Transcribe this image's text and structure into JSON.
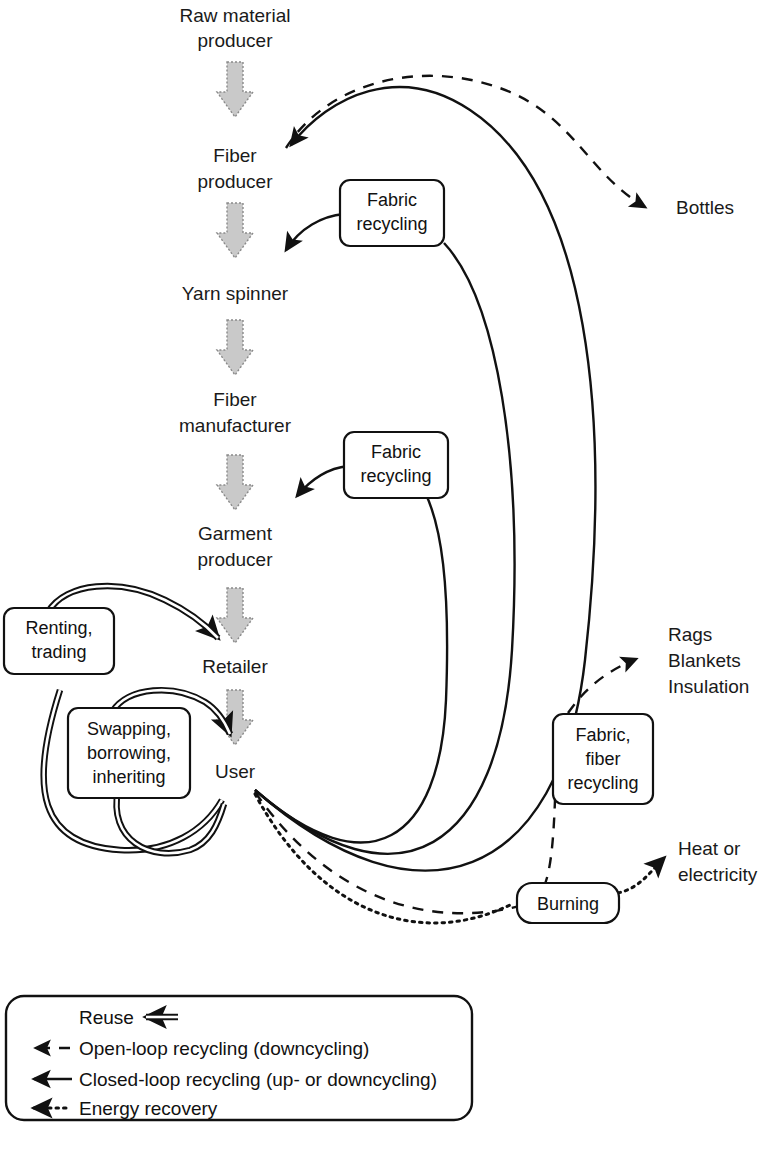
{
  "figure": {
    "type": "flow-diagram",
    "background": "#ffffff",
    "ink": "#111111",
    "gray_arrow_fill": "#c9c9c9",
    "gray_arrow_stroke": "#8a8a8a"
  },
  "chain_nodes": [
    {
      "id": "raw",
      "label_line1": "Raw material",
      "label_line2": "producer"
    },
    {
      "id": "fiberprod",
      "label_line1": "Fiber",
      "label_line2": "producer"
    },
    {
      "id": "yarn",
      "label_line1": "Yarn spinner",
      "label_line2": ""
    },
    {
      "id": "fibermfg",
      "label_line1": "Fiber",
      "label_line2": "manufacturer"
    },
    {
      "id": "garment",
      "label_line1": "Garment",
      "label_line2": "producer"
    },
    {
      "id": "retailer",
      "label_line1": "Retailer",
      "label_line2": ""
    },
    {
      "id": "user",
      "label_line1": "User",
      "label_line2": ""
    }
  ],
  "process_boxes": [
    {
      "id": "renting",
      "lines": [
        "Renting,",
        "trading"
      ]
    },
    {
      "id": "swapping",
      "lines": [
        "Swapping,",
        "borrowing,",
        "inheriting"
      ]
    },
    {
      "id": "fabric1",
      "lines": [
        "Fabric",
        "recycling"
      ]
    },
    {
      "id": "fabric2",
      "lines": [
        "Fabric",
        "recycling"
      ]
    },
    {
      "id": "fabfiber",
      "lines": [
        "Fabric,",
        "fiber",
        "recycling"
      ]
    },
    {
      "id": "burning",
      "lines": [
        "Burning"
      ]
    }
  ],
  "output_labels": [
    {
      "id": "bottles",
      "lines": [
        "Bottles"
      ]
    },
    {
      "id": "rags",
      "lines": [
        "Rags",
        "Blankets",
        "Insulation"
      ]
    },
    {
      "id": "heat",
      "lines": [
        "Heat or",
        "electricity"
      ]
    }
  ],
  "legend": {
    "items": [
      {
        "style": "reuse",
        "label": "Reuse"
      },
      {
        "style": "dashed",
        "label": "Open-loop recycling (downcycling)"
      },
      {
        "style": "solid",
        "label": "Closed-loop recycling (up- or downcycling)"
      },
      {
        "style": "dotted",
        "label": "Energy recovery"
      }
    ]
  }
}
